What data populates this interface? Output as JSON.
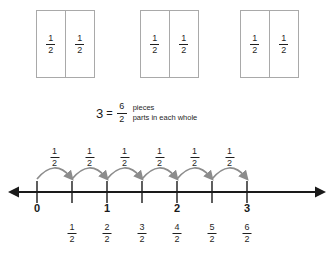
{
  "diagram": {
    "fraction_label": {
      "numerator": "1",
      "denominator": "2"
    },
    "colors": {
      "box_stroke": "#a9a9a9",
      "line": "#1a1a1a",
      "arc": "#8c8c8c",
      "text": "#1f1f1f"
    }
  },
  "whole_models": {
    "count": 3,
    "boxes": [
      {
        "parts": [
          {
            "numerator": "1",
            "denominator": "2"
          },
          {
            "numerator": "1",
            "denominator": "2"
          }
        ]
      },
      {
        "parts": [
          {
            "numerator": "1",
            "denominator": "2"
          },
          {
            "numerator": "1",
            "denominator": "2"
          }
        ]
      },
      {
        "parts": [
          {
            "numerator": "1",
            "denominator": "2"
          },
          {
            "numerator": "1",
            "denominator": "2"
          }
        ]
      }
    ]
  },
  "equation": {
    "whole_number": "3",
    "equals": "=",
    "numerator": "6",
    "denominator": "2",
    "numerator_label": "pieces",
    "denominator_label": "parts in each whole"
  },
  "number_line": {
    "start_value": 0,
    "end_value": 3,
    "tick_count": 7,
    "hop_labels": [
      {
        "numerator": "1",
        "denominator": "2"
      },
      {
        "numerator": "1",
        "denominator": "2"
      },
      {
        "numerator": "1",
        "denominator": "2"
      },
      {
        "numerator": "1",
        "denominator": "2"
      },
      {
        "numerator": "1",
        "denominator": "2"
      },
      {
        "numerator": "1",
        "denominator": "2"
      }
    ],
    "whole_labels": [
      {
        "tick": 0,
        "text": "0"
      },
      {
        "tick": 2,
        "text": "1"
      },
      {
        "tick": 4,
        "text": "2"
      },
      {
        "tick": 6,
        "text": "3"
      }
    ],
    "fraction_labels": [
      {
        "tick": 1,
        "numerator": "1",
        "denominator": "2"
      },
      {
        "tick": 2,
        "numerator": "2",
        "denominator": "2"
      },
      {
        "tick": 3,
        "numerator": "3",
        "denominator": "2"
      },
      {
        "tick": 4,
        "numerator": "4",
        "denominator": "2"
      },
      {
        "tick": 5,
        "numerator": "5",
        "denominator": "2"
      },
      {
        "tick": 6,
        "numerator": "6",
        "denominator": "2"
      }
    ],
    "geometry": {
      "first_tick_x": 37,
      "tick_spacing": 35,
      "axis_y": 52,
      "left_arrow_x": 8,
      "right_arrow_x": 326
    }
  }
}
